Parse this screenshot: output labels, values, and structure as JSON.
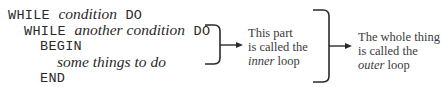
{
  "code": {
    "lines": [
      {
        "indent": 0,
        "parts": [
          {
            "kind": "kw",
            "text": "WHILE "
          },
          {
            "kind": "it",
            "text": "condition"
          },
          {
            "kind": "kw",
            "text": " DO"
          }
        ]
      },
      {
        "indent": 1,
        "parts": [
          {
            "kind": "kw",
            "text": "WHILE "
          },
          {
            "kind": "it",
            "text": "another condition"
          },
          {
            "kind": "kw",
            "text": " DO"
          }
        ]
      },
      {
        "indent": 2,
        "parts": [
          {
            "kind": "kw",
            "text": "BEGIN"
          }
        ]
      },
      {
        "indent": 3,
        "parts": [
          {
            "kind": "it",
            "text": "some things to do"
          }
        ]
      },
      {
        "indent": 2,
        "parts": [
          {
            "kind": "kw",
            "text": "END"
          }
        ]
      }
    ],
    "l0": {
      "a": "WHILE ",
      "b": "condition",
      "c": " DO"
    },
    "l1": {
      "a": "WHILE ",
      "b": "another condition",
      "c": " DO"
    },
    "l2": {
      "a": "BEGIN"
    },
    "l3": {
      "b": "some things to do"
    },
    "l4": {
      "a": "END"
    }
  },
  "inner_note": {
    "line1": "This part",
    "line2": "is called the",
    "line3_italic": "inner",
    "line3_rest": " loop"
  },
  "outer_note": {
    "line1": "The whole thing",
    "line2": "is called the",
    "line3_italic": "outer",
    "line3_rest": " loop"
  },
  "colors": {
    "ink": "#2a2a2a",
    "background": "#ffffff"
  }
}
